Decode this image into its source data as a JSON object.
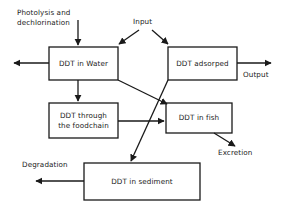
{
  "diagram": {
    "stroke_color": "#1a1a1a",
    "background_color": "#ffffff",
    "boxes": [
      {
        "id": "water",
        "label": "DDT in Water",
        "x": 49,
        "y": 47,
        "w": 69,
        "h": 33
      },
      {
        "id": "adsorped",
        "label": "DDT adsorped",
        "x": 168,
        "y": 47,
        "w": 69,
        "h": 33
      },
      {
        "id": "foodchain",
        "label": "DDT through\nthe foodchain",
        "x": 49,
        "y": 103,
        "w": 69,
        "h": 35
      },
      {
        "id": "fish",
        "label": "DDT in fish",
        "x": 166,
        "y": 103,
        "w": 66,
        "h": 30
      },
      {
        "id": "sediment",
        "label": "DDT in sediment",
        "x": 84,
        "y": 163,
        "w": 116,
        "h": 37
      }
    ],
    "labels": [
      {
        "id": "photolysis",
        "text": "Photolysis and\ndechlorination",
        "x": 17,
        "y": 8
      },
      {
        "id": "input",
        "text": "Input",
        "x": 133,
        "y": 17
      },
      {
        "id": "output",
        "text": "Output",
        "x": 243,
        "y": 70
      },
      {
        "id": "excretion",
        "text": "Excretion",
        "x": 218,
        "y": 148
      },
      {
        "id": "degradation",
        "text": "Degradation",
        "x": 22,
        "y": 160
      }
    ]
  }
}
